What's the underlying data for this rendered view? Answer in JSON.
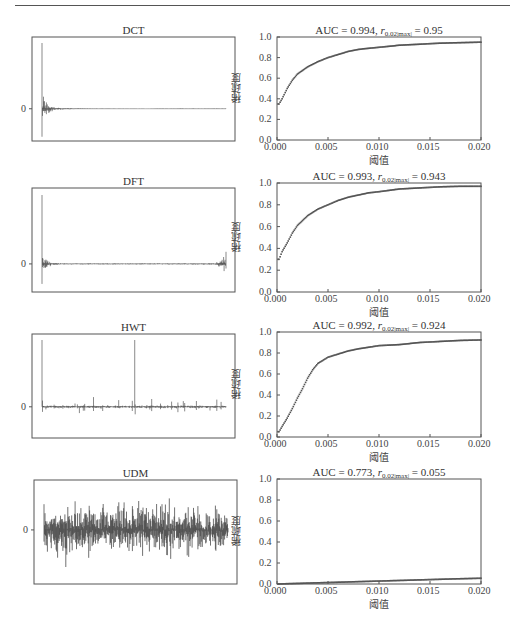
{
  "header_rule": true,
  "chart_data": [
    {
      "type": "line",
      "title": "DCT",
      "panel": "left-row-1",
      "description": "Transform coefficients of a signal under DCT: energy compacted at the start, decaying to ~0",
      "ytick_labels": [
        "0"
      ],
      "xlabel": "",
      "ylabel": "",
      "grid": false
    },
    {
      "type": "scatter",
      "title": "AUC = 0.994, r_0.02|max| = 0.95",
      "auc": 0.994,
      "r_value": 0.95,
      "xlabel": "阈值",
      "ylabel": "稀疏度",
      "xlim": [
        0.0,
        0.02
      ],
      "ylim": [
        0.0,
        1.0
      ],
      "xtick_labels": [
        "0.000",
        "0.005",
        "0.010",
        "0.015",
        "0.020"
      ],
      "ytick_labels": [
        "0.0",
        "0.2",
        "0.4",
        "0.6",
        "0.8",
        "1.0"
      ],
      "x": [
        0.0002,
        0.0005,
        0.001,
        0.0015,
        0.002,
        0.003,
        0.004,
        0.005,
        0.006,
        0.007,
        0.008,
        0.009,
        0.01,
        0.012,
        0.014,
        0.016,
        0.018,
        0.02
      ],
      "y": [
        0.35,
        0.4,
        0.5,
        0.58,
        0.64,
        0.71,
        0.76,
        0.8,
        0.83,
        0.86,
        0.88,
        0.89,
        0.9,
        0.92,
        0.93,
        0.94,
        0.945,
        0.95
      ],
      "grid": false
    },
    {
      "type": "line",
      "title": "DFT",
      "panel": "left-row-2",
      "description": "DFT coefficients: symmetric bursts at both ends, near-zero in the middle",
      "ytick_labels": [
        "0"
      ],
      "grid": false
    },
    {
      "type": "scatter",
      "title": "AUC = 0.993, r_0.02|max| = 0.943",
      "auc": 0.993,
      "r_value": 0.943,
      "xlabel": "阈值",
      "ylabel": "稀疏度",
      "xlim": [
        0.0,
        0.02
      ],
      "ylim": [
        0.0,
        1.0
      ],
      "xtick_labels": [
        "0.000",
        "0.005",
        "0.010",
        "0.015",
        "0.020"
      ],
      "ytick_labels": [
        "0.0",
        "0.2",
        "0.4",
        "0.6",
        "0.8",
        "1.0"
      ],
      "x": [
        0.0002,
        0.0005,
        0.001,
        0.0015,
        0.002,
        0.003,
        0.004,
        0.005,
        0.006,
        0.007,
        0.008,
        0.009,
        0.01,
        0.012,
        0.014,
        0.016,
        0.018,
        0.02
      ],
      "y": [
        0.3,
        0.37,
        0.45,
        0.54,
        0.61,
        0.7,
        0.76,
        0.8,
        0.84,
        0.87,
        0.89,
        0.91,
        0.92,
        0.945,
        0.955,
        0.965,
        0.97,
        0.97
      ],
      "grid": false
    },
    {
      "type": "line",
      "title": "HWT",
      "panel": "left-row-3",
      "description": "Haar wavelet coefficients: two large spikes (start and mid) plus sparse smaller spikes",
      "ytick_labels": [
        "0"
      ],
      "grid": false
    },
    {
      "type": "scatter",
      "title": "AUC = 0.992, r_0.02|max| = 0.924",
      "auc": 0.992,
      "r_value": 0.924,
      "xlabel": "阈值",
      "ylabel": "稀疏度",
      "xlim": [
        0.0,
        0.02
      ],
      "ylim": [
        0.0,
        1.0
      ],
      "xtick_labels": [
        "0.000",
        "0.005",
        "0.010",
        "0.015",
        "0.020"
      ],
      "ytick_labels": [
        "0.0",
        "0.2",
        "0.4",
        "0.6",
        "0.8",
        "1.0"
      ],
      "x": [
        0.0002,
        0.0005,
        0.001,
        0.0015,
        0.002,
        0.0025,
        0.003,
        0.0035,
        0.004,
        0.005,
        0.006,
        0.007,
        0.008,
        0.01,
        0.012,
        0.014,
        0.016,
        0.018,
        0.02
      ],
      "y": [
        0.05,
        0.1,
        0.18,
        0.27,
        0.37,
        0.46,
        0.56,
        0.64,
        0.7,
        0.76,
        0.79,
        0.82,
        0.84,
        0.87,
        0.88,
        0.9,
        0.91,
        0.92,
        0.924
      ],
      "grid": false
    },
    {
      "type": "line",
      "title": "UDM",
      "panel": "left-row-4",
      "description": "UDM coefficients: dense noise-like signal across full range, not sparse",
      "ytick_labels": [
        "0"
      ],
      "grid": false
    },
    {
      "type": "scatter",
      "title": "AUC = 0.773, r_0.02|max| = 0.055",
      "auc": 0.773,
      "r_value": 0.055,
      "xlabel": "阈值",
      "ylabel": "稀疏度",
      "xlim": [
        0.0,
        0.02
      ],
      "ylim": [
        0.0,
        1.0
      ],
      "xtick_labels": [
        "0.000",
        "0.005",
        "0.010",
        "0.015",
        "0.020"
      ],
      "ytick_labels": [
        "0.0",
        "0.2",
        "0.4",
        "0.6",
        "0.8",
        "1.0"
      ],
      "x": [
        0.0,
        0.0025,
        0.005,
        0.0075,
        0.01,
        0.0125,
        0.015,
        0.0175,
        0.02
      ],
      "y": [
        0.0,
        0.007,
        0.014,
        0.021,
        0.028,
        0.035,
        0.042,
        0.049,
        0.055
      ],
      "grid": false
    }
  ],
  "left_panels": [
    {
      "title": "DCT",
      "zero_label": "0"
    },
    {
      "title": "DFT",
      "zero_label": "0"
    },
    {
      "title": "HWT",
      "zero_label": "0"
    },
    {
      "title": "UDM",
      "zero_label": "0"
    }
  ],
  "right_panels": [
    {
      "auc_text": "AUC = 0.994, ",
      "r_sym": "r",
      "r_sub": "0.02|max|",
      "r_val": " = 0.95",
      "ylabel": "稀疏度",
      "xlabel": "阈值"
    },
    {
      "auc_text": "AUC = 0.993, ",
      "r_sym": "r",
      "r_sub": "0.02|max|",
      "r_val": " = 0.943",
      "ylabel": "稀疏度",
      "xlabel": "阈值"
    },
    {
      "auc_text": "AUC = 0.992, ",
      "r_sym": "r",
      "r_sub": "0.02|max|",
      "r_val": " = 0.924",
      "ylabel": "稀疏度",
      "xlabel": "阈值"
    },
    {
      "auc_text": "AUC = 0.773, ",
      "r_sym": "r",
      "r_sub": "0.02|max|",
      "r_val": " = 0.055",
      "ylabel": "稀疏度",
      "xlabel": "阈值"
    }
  ],
  "axis": {
    "xticks": [
      "0.000",
      "0.005",
      "0.010",
      "0.015",
      "0.020"
    ],
    "yticks": [
      "0.0",
      "0.2",
      "0.4",
      "0.6",
      "0.8",
      "1.0"
    ]
  },
  "colors": {
    "frame": "#555555",
    "signal": "#444444",
    "markers": "#555555"
  }
}
